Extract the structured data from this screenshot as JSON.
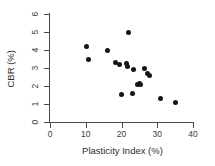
{
  "chart_data": {
    "type": "scatter",
    "title": "",
    "xlabel": "Plasticity Index (%)",
    "ylabel": "CBR (%)",
    "xlim": [
      0,
      40
    ],
    "ylim": [
      0,
      6
    ],
    "xticks": [
      0,
      10,
      20,
      30,
      40
    ],
    "yticks": [
      0,
      1,
      2,
      3,
      4,
      5,
      6
    ],
    "xtick_labels": [
      "0",
      "10",
      "20",
      "30",
      "40"
    ],
    "ytick_labels": [
      "0",
      "1",
      "2",
      "3",
      "4",
      "5",
      "6"
    ],
    "grid": false,
    "legend": null,
    "marker": "filled-circle",
    "marker_color": "#151515",
    "points": [
      {
        "x": 10.2,
        "y": 4.17
      },
      {
        "x": 10.7,
        "y": 3.47
      },
      {
        "x": 16.0,
        "y": 3.97
      },
      {
        "x": 18.3,
        "y": 3.28
      },
      {
        "x": 19.4,
        "y": 3.22
      },
      {
        "x": 20.0,
        "y": 1.53
      },
      {
        "x": 21.3,
        "y": 3.25
      },
      {
        "x": 21.6,
        "y": 3.11
      },
      {
        "x": 21.9,
        "y": 4.95
      },
      {
        "x": 23.1,
        "y": 1.58
      },
      {
        "x": 23.3,
        "y": 2.94
      },
      {
        "x": 24.6,
        "y": 2.1
      },
      {
        "x": 25.0,
        "y": 2.12
      },
      {
        "x": 25.3,
        "y": 2.08
      },
      {
        "x": 26.4,
        "y": 2.98
      },
      {
        "x": 27.2,
        "y": 2.72
      },
      {
        "x": 27.9,
        "y": 2.61
      },
      {
        "x": 31.0,
        "y": 1.33
      },
      {
        "x": 35.0,
        "y": 1.11
      }
    ]
  },
  "axes": {
    "y_title": "CBR (%)",
    "x_title": "Plasticity Index (%)"
  }
}
